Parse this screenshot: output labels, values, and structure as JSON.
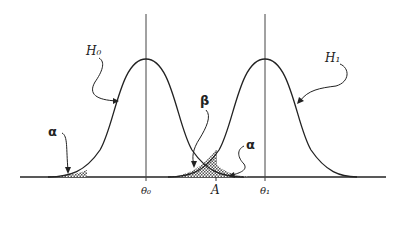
{
  "figure": {
    "type": "hypothesis-test-distributions",
    "labels": {
      "h0": "H₀",
      "h1": "H₁",
      "alpha_left": "α",
      "alpha_right": "α",
      "beta": "β",
      "theta0": "θ₀",
      "theta1": "θ₁",
      "critical_value": "A"
    },
    "colors": {
      "stroke": "#222222",
      "hatch": "#555555",
      "background": "#ffffff"
    }
  }
}
